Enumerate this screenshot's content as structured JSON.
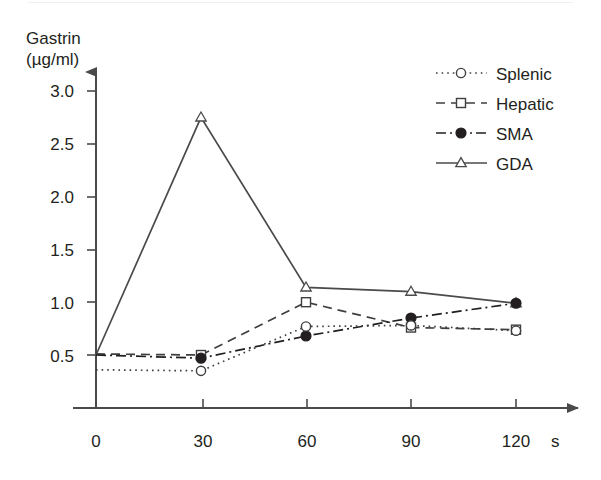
{
  "chart_data": {
    "type": "line",
    "title": "",
    "ylabel_line1": "Gastrin",
    "ylabel_line2": "(µg/ml)",
    "xlabel": "",
    "x_unit": "s",
    "x": [
      0,
      30,
      60,
      90,
      120
    ],
    "xticklabels": [
      "0",
      "30",
      "60",
      "90",
      "120"
    ],
    "yticklabels": [
      "0.5",
      "1.0",
      "1.5",
      "2.0",
      "2.5",
      "3.0"
    ],
    "yticks": [
      0.5,
      1.0,
      1.5,
      2.0,
      2.5,
      3.0
    ],
    "xlim": [
      0,
      132
    ],
    "ylim": [
      0,
      3.15
    ],
    "grid": false,
    "legend_position": "top-right",
    "series": [
      {
        "name": "Splenic",
        "values": [
          0.36,
          0.35,
          0.77,
          0.78,
          0.73
        ],
        "linestyle": "dotted",
        "marker": "open-circle",
        "color": "#3f3f3f"
      },
      {
        "name": "Hepatic",
        "values": [
          0.51,
          0.5,
          1.0,
          0.76,
          0.74
        ],
        "linestyle": "dashed",
        "marker": "open-square",
        "color": "#3f3f3f"
      },
      {
        "name": "SMA",
        "values": [
          0.5,
          0.47,
          0.68,
          0.85,
          0.99
        ],
        "linestyle": "dash-dot",
        "marker": "filled-circle",
        "color": "#231f20"
      },
      {
        "name": "GDA",
        "values": [
          0.5,
          2.75,
          1.14,
          1.1,
          0.99
        ],
        "linestyle": "solid",
        "marker": "open-triangle",
        "color": "#4a4a4a"
      }
    ]
  },
  "legend": {
    "items": [
      {
        "label": "Splenic"
      },
      {
        "label": "Hepatic"
      },
      {
        "label": "SMA"
      },
      {
        "label": "GDA"
      }
    ]
  },
  "axes": {
    "axis_color": "#4a4a4a"
  }
}
